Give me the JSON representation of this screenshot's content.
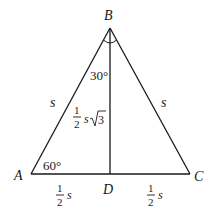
{
  "diagram": {
    "type": "equilateral-triangle-altitude",
    "colors": {
      "stroke": "#1a1a1a",
      "background": "#ffffff"
    },
    "vertices": {
      "A": {
        "label": "A"
      },
      "B": {
        "label": "B"
      },
      "C": {
        "label": "C"
      },
      "D": {
        "label": "D"
      }
    },
    "angles": {
      "A": "60°",
      "ABD": "30°"
    },
    "sides": {
      "AB": "s",
      "BC": "s",
      "BD": {
        "coef_num": "1",
        "coef_den": "2",
        "var": "s",
        "radical": "3"
      },
      "AD": {
        "coef_num": "1",
        "coef_den": "2",
        "var": "s"
      },
      "DC": {
        "coef_num": "1",
        "coef_den": "2",
        "var": "s"
      }
    }
  }
}
